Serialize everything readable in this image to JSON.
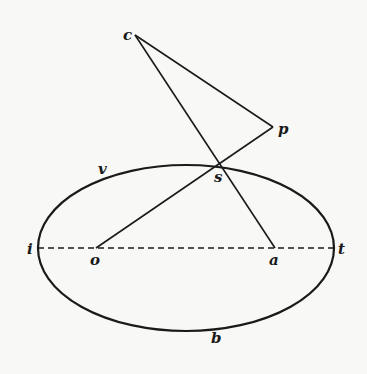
{
  "diagram": {
    "type": "geometric-figure",
    "ellipse": {
      "cx": 186,
      "cy": 248,
      "rx": 148,
      "ry": 83
    },
    "points": {
      "c": {
        "label": "c",
        "x": 135,
        "y": 35
      },
      "p": {
        "label": "p",
        "x": 273,
        "y": 127
      },
      "s": {
        "label": "s",
        "x": 221,
        "y": 165
      },
      "o": {
        "label": "o",
        "x": 96,
        "y": 248
      },
      "a": {
        "label": "a",
        "x": 275,
        "y": 248
      },
      "i": {
        "label": "i",
        "x": 38,
        "y": 248
      },
      "t": {
        "label": "t",
        "x": 334,
        "y": 248
      },
      "b": {
        "label": "b",
        "x": 215,
        "y": 331
      },
      "v": {
        "label": "v"
      }
    },
    "segments": [
      "c-p",
      "c-a",
      "o-p",
      "i-t (dashed)"
    ],
    "colors": {
      "ink": "#1a1a1a",
      "paper": "#f8f8f6"
    }
  }
}
